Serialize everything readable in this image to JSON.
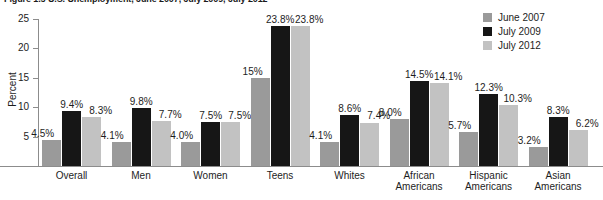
{
  "title": "Figure 1.5  U.S. Unemployment, June 2007, July 2009, July 2012",
  "axes": {
    "ylabel": "Percent",
    "yticks": [
      "5",
      "10",
      "15",
      "20",
      "25"
    ],
    "ymin": 0,
    "ymax": 25
  },
  "legend": {
    "position": "top-right",
    "items": [
      {
        "label": "June 2007",
        "color": "#9a9a9a"
      },
      {
        "label": "July 2009",
        "color": "#161616"
      },
      {
        "label": "July 2012",
        "color": "#c2c2c2"
      }
    ]
  },
  "chart_data": {
    "type": "bar",
    "title": "Figure 1.5  U.S. Unemployment, June 2007, July 2009, July 2012",
    "xlabel": "",
    "ylabel": "Percent",
    "ylim": [
      0,
      25
    ],
    "grid": false,
    "legend_position": "top-right",
    "categories": [
      "Overall",
      "Men",
      "Women",
      "Teens",
      "Whites",
      "African Americans",
      "Hispanic Americans",
      "Asian Americans"
    ],
    "series": [
      {
        "name": "June 2007",
        "color": "#9a9a9a",
        "values": [
          4.5,
          4.1,
          4.0,
          15.0,
          4.1,
          8.0,
          5.7,
          3.2
        ],
        "labels": [
          "4.5%",
          "4.1%",
          "4.0%",
          "15%",
          "4.1%",
          "8.0%",
          "5.7%",
          "3.2%"
        ]
      },
      {
        "name": "July 2009",
        "color": "#161616",
        "values": [
          9.4,
          9.8,
          7.5,
          23.8,
          8.6,
          14.5,
          12.3,
          8.3
        ],
        "labels": [
          "9.4%",
          "9.8%",
          "7.5%",
          "23.8%",
          "8.6%",
          "14.5%",
          "12.3%",
          "8.3%"
        ]
      },
      {
        "name": "July 2012",
        "color": "#c2c2c2",
        "values": [
          8.3,
          7.7,
          7.5,
          23.8,
          7.4,
          14.1,
          10.3,
          6.2
        ],
        "labels": [
          "8.3%",
          "7.7%",
          "7.5%",
          "23.8%",
          "7.4%",
          "14.1%",
          "10.3%",
          "6.2%"
        ]
      }
    ]
  },
  "category_lines": [
    [
      "Overall"
    ],
    [
      "Men"
    ],
    [
      "Women"
    ],
    [
      "Teens"
    ],
    [
      "Whites"
    ],
    [
      "African",
      "Americans"
    ],
    [
      "Hispanic",
      "Americans"
    ],
    [
      "Asian",
      "Americans"
    ]
  ]
}
